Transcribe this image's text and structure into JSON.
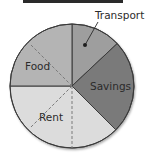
{
  "chart_data": {
    "type": "pie",
    "title": "",
    "start_angle_deg": 0,
    "direction": "clockwise",
    "slices": [
      {
        "label": "Transport",
        "value": 13,
        "color": "#9e9e9e",
        "label_position": "outside"
      },
      {
        "label": "Savings",
        "value": 24.5,
        "color": "#7a7a7a",
        "label_position": "inside"
      },
      {
        "label": "Rent",
        "value": 37.5,
        "color": "#dcdcdc",
        "label_position": "inside"
      },
      {
        "label": "Food",
        "value": 25,
        "color": "#b4b4b4",
        "label_position": "inside"
      }
    ],
    "annotations": [
      "dashed line through Food and Rent (diagonal)",
      "dashed vertical line in Rent from center to bottom",
      "leader line with dot from Transport label into Transport slice"
    ],
    "legend": "none",
    "grid": false
  },
  "labels": {
    "transport": "Transport",
    "savings": "Savings",
    "rent": "Rent",
    "food": "Food"
  }
}
